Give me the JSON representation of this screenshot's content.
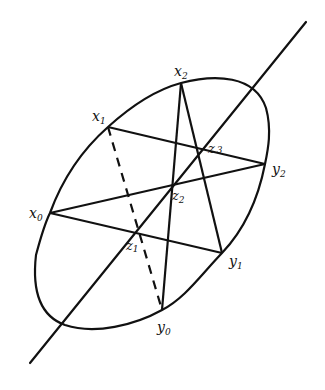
{
  "diagram": {
    "stroke_color": "#111111",
    "background": "#ffffff",
    "axis_line": {
      "x1": 306,
      "y1": 22,
      "x2": 30,
      "y2": 363
    },
    "ellipse": {
      "cx": 158,
      "cy": 196,
      "rx": 158,
      "ry": 82,
      "rotation": -47
    },
    "points": {
      "x0": {
        "label": "x",
        "sub": "0",
        "x": 50,
        "y": 213,
        "lx": 30,
        "ly": 218
      },
      "x1": {
        "label": "x",
        "sub": "1",
        "x": 108,
        "y": 127,
        "lx": 94,
        "ly": 120
      },
      "x2": {
        "label": "x",
        "sub": "2",
        "x": 181,
        "y": 83,
        "lx": 174,
        "ly": 76
      },
      "y0": {
        "label": "y",
        "sub": "0",
        "x": 162,
        "y": 310,
        "lx": 158,
        "ly": 332
      },
      "y1": {
        "label": "y",
        "sub": "1",
        "x": 222,
        "y": 253,
        "lx": 229,
        "ly": 266
      },
      "y2": {
        "label": "y",
        "sub": "2",
        "x": 265,
        "y": 164,
        "lx": 272,
        "ly": 174
      },
      "z1": {
        "label": "z",
        "sub": "1",
        "x": 134,
        "y": 232,
        "lx": 127,
        "ly": 250
      },
      "z2": {
        "label": "z",
        "sub": "2",
        "x": 172,
        "y": 185,
        "lx": 173,
        "ly": 200
      },
      "z3": {
        "label": "z",
        "sub": "3",
        "x": 199,
        "y": 150,
        "lx": 209,
        "ly": 152
      }
    },
    "segments": [
      {
        "from": "x1",
        "to": "y2",
        "style": "solid"
      },
      {
        "from": "x0",
        "to": "y2",
        "style": "solid"
      },
      {
        "from": "x0",
        "to": "y1",
        "style": "solid"
      },
      {
        "from": "x2",
        "to": "y0",
        "style": "solid"
      },
      {
        "from": "x2",
        "to": "y1",
        "style": "solid"
      },
      {
        "from": "x1",
        "to": "y0",
        "style": "dashed"
      }
    ],
    "labels": {
      "x0": "x",
      "x0_sub": "0",
      "x1": "x",
      "x1_sub": "1",
      "x2": "x",
      "x2_sub": "2",
      "y0": "y",
      "y0_sub": "0",
      "y1": "y",
      "y1_sub": "1",
      "y2": "y",
      "y2_sub": "2",
      "z1": "z",
      "z1_sub": "1",
      "z2": "z",
      "z2_sub": "2",
      "z3": "z",
      "z3_sub": "3"
    }
  }
}
